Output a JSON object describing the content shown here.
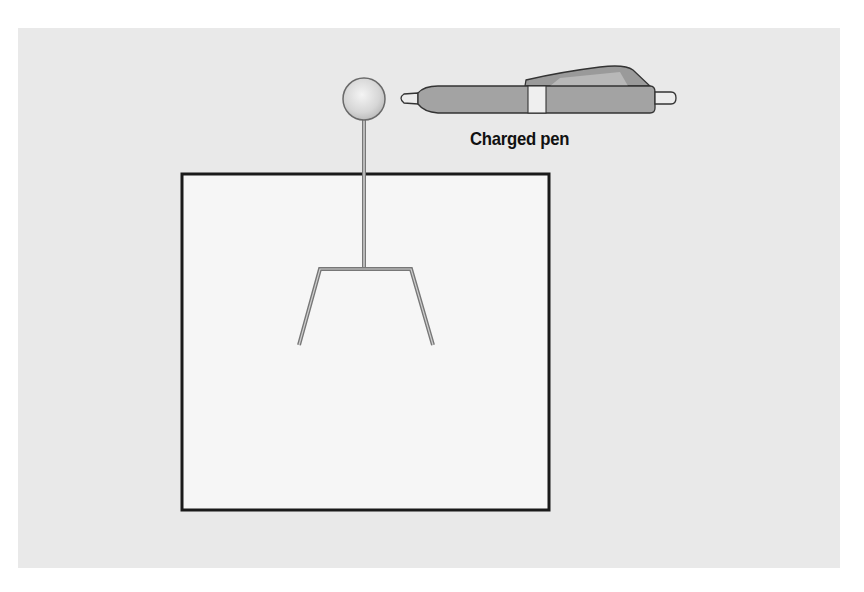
{
  "diagram": {
    "labels": {
      "pen": "Charged pen"
    },
    "elements": {
      "background_panel": "light-gray-panel",
      "jar": "box",
      "electroscope": {
        "sphere": "metal-sphere",
        "rod": "metal-rod",
        "leaves": "metal-leaves"
      },
      "pen": "charged-pen"
    },
    "colors": {
      "panel": "#e9e9e9",
      "box_fill": "#f6f6f6",
      "box_stroke": "#1a1a1a",
      "metal": "#8a8a8a",
      "pen_body": "#a3a3a3",
      "pen_band": "#efefef",
      "label": "#111111"
    }
  }
}
